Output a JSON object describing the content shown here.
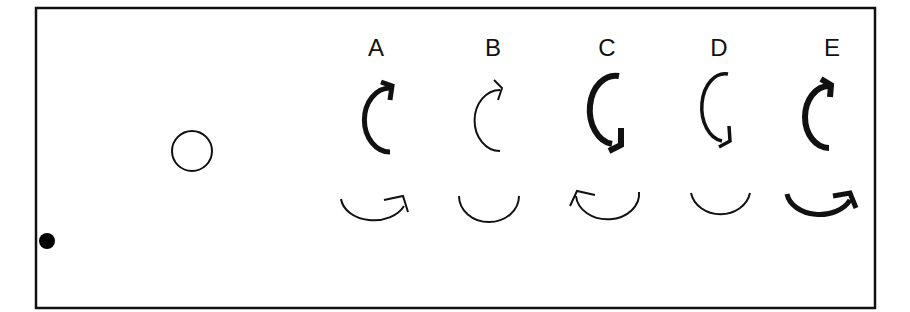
{
  "diagram": {
    "objects": {
      "ball": {
        "shape": "filled-circle",
        "color": "#000000"
      },
      "target": {
        "shape": "hollow-circle",
        "color": "#000000"
      }
    },
    "options": [
      {
        "label": "A",
        "top_arrow": {
          "direction": "clockwise-up",
          "weight": "thick"
        },
        "bottom_arrow": {
          "direction": "arrowhead-right",
          "weight": "thin"
        }
      },
      {
        "label": "B",
        "top_arrow": {
          "direction": "clockwise-up",
          "weight": "thin"
        },
        "bottom_arrow": {
          "direction": "none",
          "weight": "thin"
        }
      },
      {
        "label": "C",
        "top_arrow": {
          "direction": "counterclockwise-down",
          "weight": "thick"
        },
        "bottom_arrow": {
          "direction": "arrowhead-left",
          "weight": "thin"
        }
      },
      {
        "label": "D",
        "top_arrow": {
          "direction": "counterclockwise-down",
          "weight": "medium"
        },
        "bottom_arrow": {
          "direction": "none",
          "weight": "thin"
        }
      },
      {
        "label": "E",
        "top_arrow": {
          "direction": "clockwise-up",
          "weight": "thick"
        },
        "bottom_arrow": {
          "direction": "arrowhead-right",
          "weight": "thick"
        }
      }
    ]
  }
}
